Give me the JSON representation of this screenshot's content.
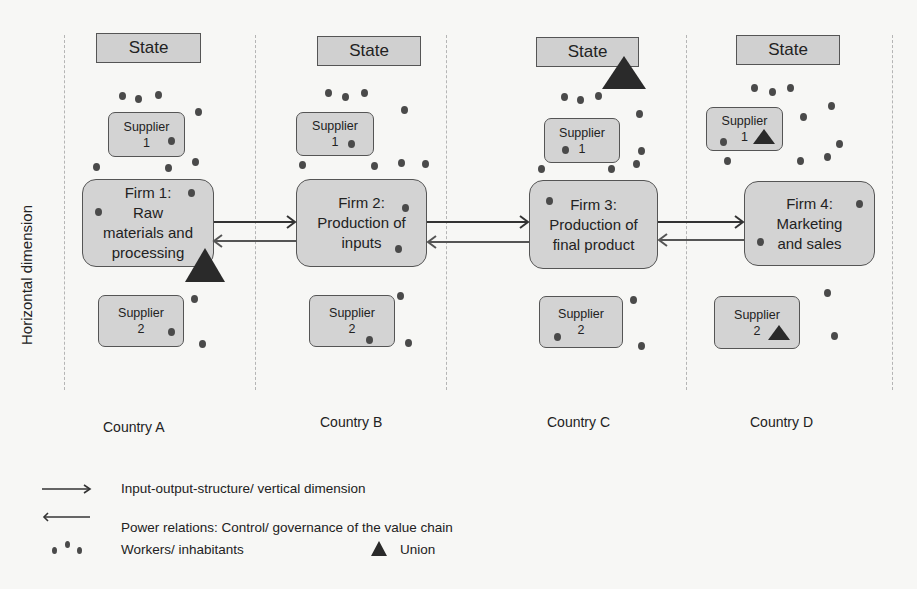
{
  "axis_label": "Horizontal dimension",
  "columns": [
    {
      "country": "Country A",
      "state": "State",
      "supplier1": {
        "line1": "Supplier",
        "line2": "1"
      },
      "firm": {
        "lines": [
          "Firm 1:",
          "Raw",
          "materials and",
          "processing"
        ]
      },
      "supplier2": {
        "line1": "Supplier",
        "line2": "2"
      },
      "union_positions": [
        "firm"
      ]
    },
    {
      "country": "Country B",
      "state": "State",
      "supplier1": {
        "line1": "Supplier",
        "line2": "1"
      },
      "firm": {
        "lines": [
          "Firm 2:",
          "Production of",
          "inputs"
        ]
      },
      "supplier2": {
        "line1": "Supplier",
        "line2": "2"
      },
      "union_positions": []
    },
    {
      "country": "Country C",
      "state": "State",
      "supplier1": {
        "line1": "Supplier",
        "line2": "1"
      },
      "firm": {
        "lines": [
          "Firm 3:",
          "Production of",
          "final product"
        ]
      },
      "supplier2": {
        "line1": "Supplier",
        "line2": "2"
      },
      "union_positions": [
        "state"
      ]
    },
    {
      "country": "Country D",
      "state": "State",
      "supplier1": {
        "line1": "Supplier",
        "line2": "1"
      },
      "firm": {
        "lines": [
          "Firm 4:",
          "Marketing",
          "and sales"
        ]
      },
      "supplier2": {
        "line1": "Supplier",
        "line2": "2"
      },
      "union_positions": [
        "supplier1",
        "supplier2"
      ]
    }
  ],
  "legend": {
    "input_output": "Input-output-structure/ vertical dimension",
    "power_relations": "Power relations: Control/ governance of the value chain",
    "workers": "Workers/ inhabitants",
    "union": "Union"
  },
  "colors": {
    "box_fill": "#d3d3d3",
    "box_border": "#555555",
    "dot": "#4a4a4a",
    "union": "#2a2a2a",
    "divider": "#b5b5b5"
  }
}
